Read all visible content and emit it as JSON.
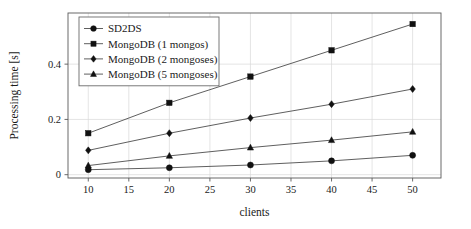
{
  "chart_data": {
    "type": "line",
    "title": "",
    "xlabel": "clients",
    "ylabel": "Processing time [s]",
    "x": [
      10,
      20,
      30,
      40,
      50
    ],
    "xlim": [
      7.5,
      53.5
    ],
    "ylim": [
      -0.012,
      0.585
    ],
    "xticks": [
      10,
      15,
      20,
      25,
      30,
      35,
      40,
      45,
      50
    ],
    "xtick_labels": [
      "10",
      "15",
      "20",
      "25",
      "30",
      "35",
      "40",
      "45",
      "50"
    ],
    "yticks": [
      0,
      0.2,
      0.4
    ],
    "ytick_labels": [
      "0",
      "0.2",
      "0.4"
    ],
    "grid": true,
    "legend_position": "top-left",
    "series": [
      {
        "name": "SD2DS",
        "marker": "circle",
        "values": [
          0.018,
          0.025,
          0.035,
          0.05,
          0.07
        ]
      },
      {
        "name": "MongoDB (1 mongos)",
        "marker": "square",
        "values": [
          0.15,
          0.26,
          0.355,
          0.45,
          0.545
        ]
      },
      {
        "name": "MongoDB (2 mongoses)",
        "marker": "diamond",
        "values": [
          0.088,
          0.15,
          0.205,
          0.255,
          0.31
        ]
      },
      {
        "name": "MongoDB (5 mongoses)",
        "marker": "triangle",
        "values": [
          0.033,
          0.068,
          0.098,
          0.125,
          0.155
        ]
      }
    ],
    "colors": {
      "line": "#4d4d4d",
      "marker": "#111111",
      "grid": "#d9d9d9",
      "frame": "#5a5a5a",
      "text": "#1a1a1a",
      "background": "#ffffff"
    }
  }
}
